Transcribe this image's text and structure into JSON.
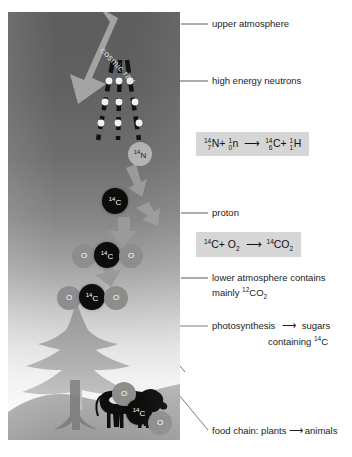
{
  "diagram": {
    "panel": {
      "cosmic_ray_label": "cosmic ray",
      "atoms": {
        "nitrogen14": "14N",
        "carbon14": "14C",
        "oxygen": "O"
      }
    },
    "labels": [
      {
        "id": "upper-atmosphere",
        "text": "upper atmosphere"
      },
      {
        "id": "high-energy-neutrons",
        "text": "high energy neutrons"
      },
      {
        "id": "proton",
        "text": "proton"
      },
      {
        "id": "lower-atmosphere-line1",
        "text": "lower atmosphere contains"
      },
      {
        "id": "lower-atmosphere-line2",
        "text": "mainly 12CO2"
      },
      {
        "id": "photosynthesis",
        "text": "photosynthesis"
      },
      {
        "id": "sugars-line1",
        "text": "sugars"
      },
      {
        "id": "sugars-line2",
        "text": "containing 14C"
      },
      {
        "id": "food-chain",
        "text": "food chain: plants → animals"
      }
    ],
    "equations": {
      "nuclear": {
        "reactant_1_mass": "14",
        "reactant_1_atomic": "7",
        "reactant_1_symbol": "N",
        "reactant_2_mass": "1",
        "reactant_2_atomic": "0",
        "reactant_2_symbol": "n",
        "product_1_mass": "14",
        "product_1_atomic": "6",
        "product_1_symbol": "C",
        "product_2_mass": "1",
        "product_2_atomic": "1",
        "product_2_symbol": "H",
        "plain": "14/7 N + 1/0 n → 14/6 C + 1/1 H"
      },
      "oxidation": {
        "reactant_1": "14C",
        "reactant_2": "O2",
        "product": "14CO2",
        "plain": "14C + O2 → 14CO2"
      }
    },
    "colors": {
      "sky_top": "#5d5d5d",
      "sky_bottom": "#ffffff",
      "carbon14": "#0c0c0c",
      "oxygen": "#8d8d8d",
      "equation_box": "#d6d6d6",
      "arrow": "#9a9a9a",
      "leader_line": "#6b6b6b",
      "text": "#1c1c1c"
    }
  }
}
